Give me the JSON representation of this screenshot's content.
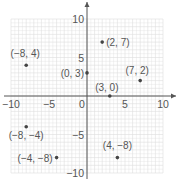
{
  "chart_data": {
    "type": "scatter",
    "title": "",
    "xlabel": "",
    "ylabel": "",
    "xlim": [
      -10,
      10
    ],
    "ylim": [
      -10,
      10
    ],
    "grid": true,
    "x_ticks": [
      -10,
      -5,
      0,
      5,
      10
    ],
    "y_ticks": [
      -10,
      -5,
      5,
      10
    ],
    "x_tick_labels": [
      "−10",
      "−5",
      "0",
      "5",
      "10"
    ],
    "y_tick_labels": [
      "−10",
      "−5",
      "5",
      "10"
    ],
    "points": [
      {
        "x": -8,
        "y": 4,
        "label": "(−8, 4)"
      },
      {
        "x": 2,
        "y": 7,
        "label": "(2, 7)"
      },
      {
        "x": 0,
        "y": 3,
        "label": "(0, 3)"
      },
      {
        "x": 7,
        "y": 2,
        "label": "(7, 2)"
      },
      {
        "x": 3,
        "y": 0,
        "label": "(3, 0)"
      },
      {
        "x": -8,
        "y": -4,
        "label": "(−8, −4)"
      },
      {
        "x": -4,
        "y": -8,
        "label": "(−4, −8)"
      },
      {
        "x": 4,
        "y": -8,
        "label": "(4, −8)"
      }
    ]
  },
  "colors": {
    "grid": "#dddddd",
    "axis": "#555555",
    "point": "#444444",
    "label": "#555555"
  }
}
